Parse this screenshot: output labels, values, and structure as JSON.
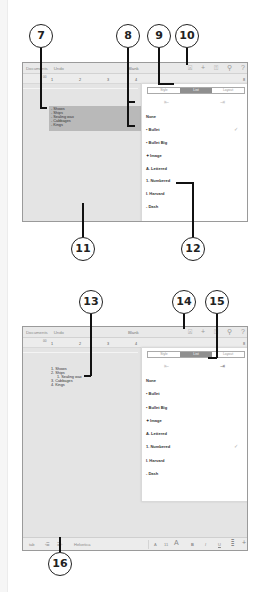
{
  "screenshot_1": {
    "topbar": {
      "documents_label": "Documents",
      "undo_label": "Undo",
      "title": "Blank",
      "icons": [
        "format-brush-icon",
        "plus-icon",
        "share-icon",
        "wrench-icon",
        "help-icon"
      ],
      "icon_glyphs": [
        "⍓",
        "+",
        "⍐",
        "⚲",
        "?"
      ]
    },
    "ruler": {
      "marks": [
        "1",
        "2",
        "3",
        "4",
        "8"
      ],
      "indent_label": "00"
    },
    "selected_list": [
      "Shows",
      "Ships",
      "Sealing wax",
      "Cabbages",
      "Kings"
    ],
    "popover": {
      "tabs": [
        "Style",
        "List",
        "Layout"
      ],
      "active_tab": "List",
      "indent_decrease_glyph": "⇤",
      "indent_increase_glyph": "⇥",
      "styles": [
        {
          "label": "None",
          "checked": false
        },
        {
          "label": "• Bullet",
          "checked": true
        },
        {
          "label": "•  Bullet Big",
          "checked": false
        },
        {
          "label": "✦ Image",
          "checked": false
        },
        {
          "label": "A.  Lettered",
          "checked": false
        },
        {
          "label": "1.  Numbered",
          "checked": false
        },
        {
          "label": "I.   Harvard",
          "checked": false
        },
        {
          "label": "-  Dash",
          "checked": false
        }
      ],
      "check_glyph": "✓"
    }
  },
  "screenshot_2": {
    "topbar": {
      "documents_label": "Documents",
      "undo_label": "Undo",
      "title": "Blank",
      "icon_glyphs": [
        "⍓",
        "+",
        "⍐",
        "⚲",
        "?"
      ]
    },
    "ruler": {
      "marks": [
        "1",
        "2",
        "3",
        "4",
        "8"
      ],
      "indent_label": "00"
    },
    "numbered_list": [
      {
        "marker": "1.",
        "text": "Shows",
        "level": 0
      },
      {
        "marker": "2.",
        "text": "Ships",
        "level": 0
      },
      {
        "marker": "1.",
        "text": "Sealing wax",
        "level": 1
      },
      {
        "marker": "3.",
        "text": "Cabbages",
        "level": 0
      },
      {
        "marker": "4.",
        "text": "Kings",
        "level": 0
      }
    ],
    "popover": {
      "tabs": [
        "Style",
        "List",
        "Layout"
      ],
      "active_tab": "List",
      "styles": [
        {
          "label": "None",
          "checked": false
        },
        {
          "label": "• Bullet",
          "checked": false
        },
        {
          "label": "•  Bullet Big",
          "checked": false
        },
        {
          "label": "✦ Image",
          "checked": false
        },
        {
          "label": "A.  Lettered",
          "checked": false
        },
        {
          "label": "1.  Numbered",
          "checked": true
        },
        {
          "label": "I.   Harvard",
          "checked": false
        },
        {
          "label": "-  Dash",
          "checked": false
        }
      ],
      "check_glyph": "✓"
    },
    "bottombar": {
      "tab_label": "tab",
      "outdent_glyph": "‹☰",
      "indent_glyph": "☰›",
      "font_name": "Helvetica",
      "font_small": "A",
      "font_size": "11",
      "font_large": "A",
      "bold": "B",
      "italic": "I",
      "underline": "U",
      "align_glyph": "≣",
      "insert_glyph": "+"
    }
  },
  "callouts": [
    "7",
    "8",
    "9",
    "10",
    "11",
    "12",
    "13",
    "14",
    "15",
    "16"
  ]
}
